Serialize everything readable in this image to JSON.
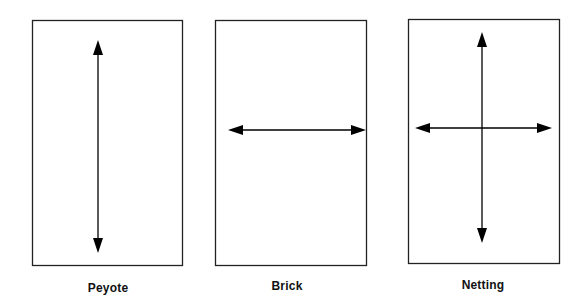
{
  "diagram": {
    "stroke_color": "#222222",
    "arrow_color": "#000000",
    "panels": [
      {
        "id": "peyote",
        "label": "Peyote",
        "box": {
          "x": 32,
          "y": 20,
          "w": 150,
          "h": 245
        },
        "arrows": [
          {
            "direction": "vertical-bidirectional",
            "x1": 98,
            "y1": 40,
            "x2": 98,
            "y2": 253
          }
        ],
        "label_pos": {
          "x": 108,
          "y": 280
        }
      },
      {
        "id": "brick",
        "label": "Brick",
        "box": {
          "x": 215,
          "y": 20,
          "w": 151,
          "h": 245
        },
        "arrows": [
          {
            "direction": "horizontal-bidirectional",
            "x1": 228,
            "y1": 130,
            "x2": 366,
            "y2": 130
          }
        ],
        "label_pos": {
          "x": 287,
          "y": 280
        }
      },
      {
        "id": "netting",
        "label": "Netting",
        "box": {
          "x": 408,
          "y": 19,
          "w": 151,
          "h": 244
        },
        "arrows": [
          {
            "direction": "vertical-bidirectional",
            "x1": 482,
            "y1": 32,
            "x2": 482,
            "y2": 243
          },
          {
            "direction": "horizontal-bidirectional",
            "x1": 415,
            "y1": 128,
            "x2": 552,
            "y2": 128
          }
        ],
        "label_pos": {
          "x": 483,
          "y": 278
        }
      }
    ]
  }
}
